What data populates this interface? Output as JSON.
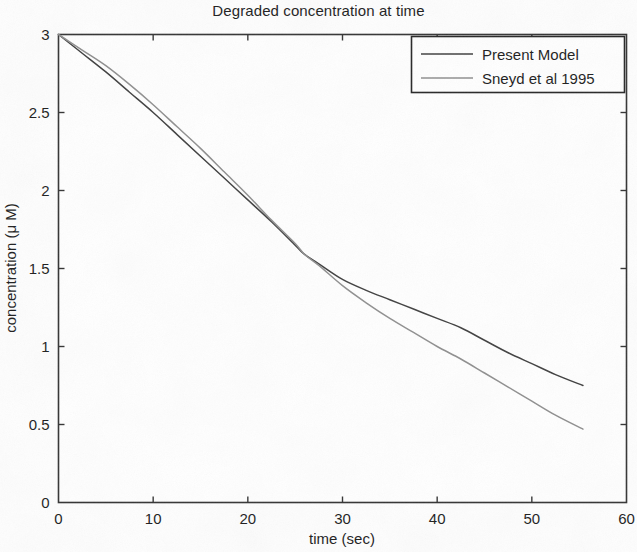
{
  "chart_data": {
    "type": "line",
    "title": "Degraded concentration at time",
    "xlabel": "time (sec)",
    "ylabel": "concentration (μ M)",
    "xlim": [
      0,
      60
    ],
    "ylim": [
      0,
      3
    ],
    "xticks": [
      "0",
      "10",
      "20",
      "30",
      "40",
      "50",
      "60"
    ],
    "xtick_values": [
      0,
      10,
      20,
      30,
      40,
      50,
      60
    ],
    "yticks": [
      "0",
      "0.5",
      "1",
      "1.5",
      "2",
      "2.5",
      "3"
    ],
    "ytick_values": [
      0,
      0.5,
      1,
      1.5,
      2,
      2.5,
      3
    ],
    "grid": false,
    "legend_position": "top-right",
    "x": [
      0,
      2.5,
      5,
      7.5,
      10,
      12.5,
      15,
      17.5,
      20,
      22.5,
      25,
      26,
      27.5,
      30,
      32.5,
      35,
      37.5,
      40,
      42.5,
      45,
      47.5,
      50,
      52.5,
      55.4
    ],
    "series": [
      {
        "name": "Present Model",
        "color": "#3f3f3f",
        "values": [
          3.0,
          2.88,
          2.76,
          2.63,
          2.5,
          2.36,
          2.22,
          2.08,
          1.94,
          1.8,
          1.65,
          1.59,
          1.53,
          1.43,
          1.36,
          1.3,
          1.24,
          1.18,
          1.12,
          1.04,
          0.96,
          0.89,
          0.82,
          0.75
        ]
      },
      {
        "name": "Sneyd et al 1995",
        "color": "#8f8f8f",
        "values": [
          3.0,
          2.9,
          2.8,
          2.68,
          2.55,
          2.41,
          2.27,
          2.12,
          1.97,
          1.81,
          1.66,
          1.59,
          1.52,
          1.39,
          1.28,
          1.18,
          1.09,
          1.0,
          0.92,
          0.83,
          0.74,
          0.65,
          0.56,
          0.47
        ]
      }
    ]
  },
  "legend": {
    "items": [
      {
        "label": "Present Model",
        "color": "#3f3f3f"
      },
      {
        "label": "Sneyd et al 1995",
        "color": "#8f8f8f"
      }
    ]
  },
  "axes": {
    "box_color": "#333333"
  }
}
